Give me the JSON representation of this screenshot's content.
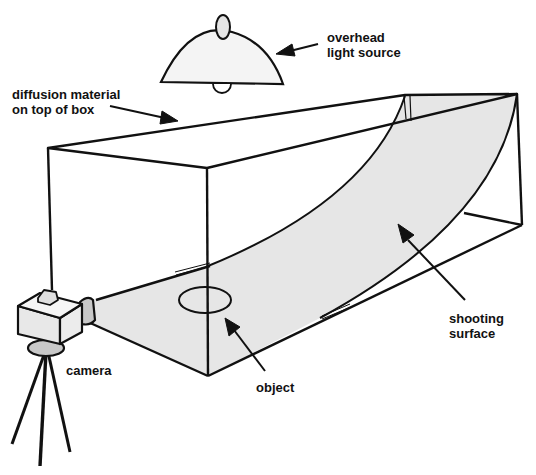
{
  "diagram": {
    "type": "illustration",
    "labels": {
      "light_source": "overhead\nlight source",
      "diffusion": "diffusion material\non top of box",
      "shooting_surface": "shooting\nsurface",
      "camera": "camera",
      "object": "object"
    },
    "colors": {
      "stroke": "#111111",
      "surface_fill": "#e6e6e6",
      "lamp_fill": "#f2f2f2",
      "camera_fill": "#e8e8e8",
      "camera_shade": "#c8c8c8",
      "background": "#ffffff"
    },
    "components": [
      {
        "id": "overhead-light",
        "label_key": "light_source"
      },
      {
        "id": "diffusion-top",
        "label_key": "diffusion"
      },
      {
        "id": "light-box",
        "label_key": null
      },
      {
        "id": "shooting-surface",
        "label_key": "shooting_surface"
      },
      {
        "id": "object",
        "label_key": "object"
      },
      {
        "id": "camera-on-tripod",
        "label_key": "camera"
      }
    ]
  }
}
